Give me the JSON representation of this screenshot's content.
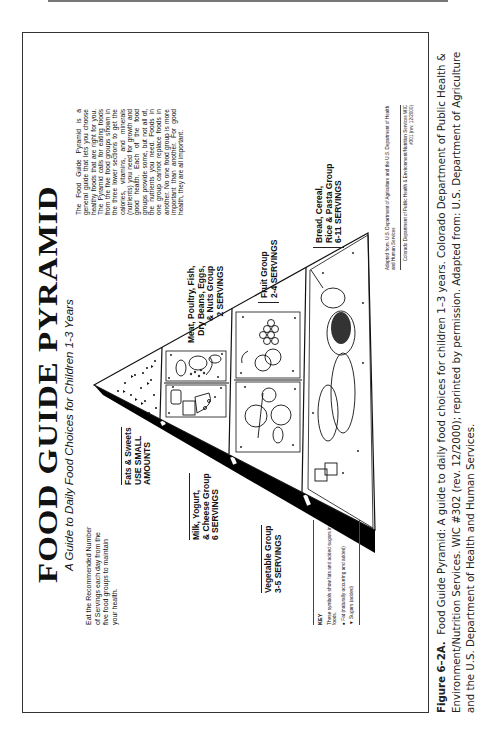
{
  "poster": {
    "title": "FOOD GUIDE PYRAMID",
    "subtitle_pre": "A Guide to ",
    "subtitle_em": "Daily Food Choices",
    "subtitle_post": " for Children 1-3 Years",
    "intro": "Eat the Recommended Number of Servings each day from the five food groups to maintain your health.",
    "about": "The Food Guide Pyramid is a general guide that lets you choose healthy foods that are right for you. The Pyramid calls for eating foods from the five food groups shown in the three lower sections to get the calories, vitamins, and minerals (nutrients) you need for growth and good health. Each of the food groups provide some, but not all of, the nutrients you need. Foods in one group cannot replace foods in another. No one food group is more important than another. For good health, they are all important.",
    "groups": {
      "fats": {
        "line1": "Fats & Sweets",
        "line2": "USE SMALL",
        "line3": "AMOUNTS"
      },
      "milk": {
        "line1": "Milk, Yogurt,",
        "line2": "& Cheese Group",
        "line3": "6 SERVINGS"
      },
      "meat": {
        "line1": "Meat, Poultry, Fish,",
        "line2": "Dry Beans, Eggs,",
        "line3": "& Nuts Group",
        "line4": "2 SERVINGS"
      },
      "vegetable": {
        "line1": "Vegetable Group",
        "line2": "3-5 SERVINGS"
      },
      "fruit": {
        "line1": "Fruit Group",
        "line2": "2-4 SERVINGS"
      },
      "bread": {
        "line1": "Bread, Cereal,",
        "line2": "Rice & Pasta Group",
        "line3": "6-11 SERVINGS"
      }
    },
    "key": {
      "title": "KEY",
      "desc": "These symbols show fats and added sugars in foods.",
      "fat_label": "Fat (naturally occurring and added)",
      "sugar_label": "Sugars (added)",
      "fat_icon": "●",
      "sugar_icon": "▼"
    },
    "credit": {
      "adapted": "Adapted from: U.S. Department of Agriculture and the U.S. Department of Health and Human Services",
      "org": "Colorado Department of Public Health & Environment/Nutrition Services   WIC #301 (rev. 12/2000)"
    }
  },
  "caption": {
    "label": "Figure 6–2A.",
    "text": "Food Guide Pyramid: A guide to daily food choices for children 1–3 years. Colorado Department of Public Health & Environment/Nutrition Services. WIC #302 (rev. 12/2000); reprinted by permission. Adapted from: U.S. Department of Agriculture and the U.S. Department of Health and Human Services."
  }
}
